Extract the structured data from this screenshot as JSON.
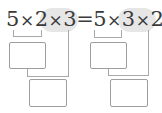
{
  "equation": {
    "left": {
      "a": "5",
      "op1": "×",
      "b": "2",
      "op2": "×",
      "c": "3"
    },
    "equals": "=",
    "right": {
      "a": "5",
      "op1": "×",
      "b": "3",
      "op2": "×",
      "c": "2"
    }
  },
  "colors": {
    "text": "#3a3a3a",
    "highlight": "#e6e6e6",
    "line": "#a8a8a8",
    "box_border": "#9e9e9e"
  },
  "answer_boxes": [
    {
      "id": "left-step1",
      "value": ""
    },
    {
      "id": "left-step2",
      "value": ""
    },
    {
      "id": "right-step1",
      "value": ""
    },
    {
      "id": "right-step2",
      "value": ""
    }
  ]
}
